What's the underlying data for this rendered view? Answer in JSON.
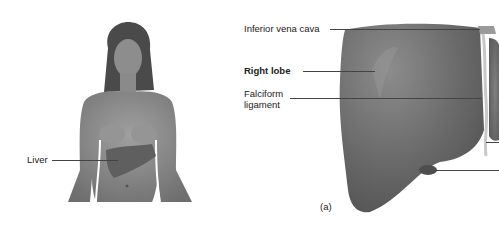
{
  "figure": {
    "panel_label": "(a)",
    "left_panel": {
      "description": "female torso with liver highlighted",
      "labels": [
        {
          "text": "Liver"
        }
      ]
    },
    "right_panel": {
      "description": "anterior view of the liver",
      "labels": [
        {
          "text": "Inferior vena cava",
          "bold": false
        },
        {
          "text": "Right lobe",
          "bold": true
        },
        {
          "text": "Falciform",
          "bold": false
        },
        {
          "text": "ligament",
          "bold": false
        }
      ]
    },
    "colors": {
      "skin": "#8a8a8a",
      "liver": "#6a6a6a",
      "label_text": "#222222",
      "leader_line": "#444444",
      "background": "#ffffff"
    }
  }
}
